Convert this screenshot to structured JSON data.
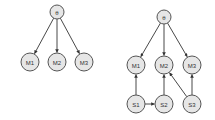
{
  "diagrams": [
    {
      "name": "left-graph",
      "nodes": [
        {
          "id": "root",
          "label": "θ",
          "x": 57,
          "y": 12,
          "r": 7
        },
        {
          "id": "M1",
          "label": "M1",
          "x": 30,
          "y": 62,
          "r": 9
        },
        {
          "id": "M2",
          "label": "M2",
          "x": 57,
          "y": 62,
          "r": 9
        },
        {
          "id": "M3",
          "label": "M3",
          "x": 84,
          "y": 62,
          "r": 9
        }
      ],
      "edges": [
        {
          "from": "root",
          "to": "M1"
        },
        {
          "from": "root",
          "to": "M2"
        },
        {
          "from": "root",
          "to": "M3"
        }
      ]
    },
    {
      "name": "right-graph",
      "nodes": [
        {
          "id": "root",
          "label": "θ",
          "x": 164,
          "y": 17,
          "r": 7
        },
        {
          "id": "M1",
          "label": "M1",
          "x": 136,
          "y": 65,
          "r": 9
        },
        {
          "id": "M2",
          "label": "M2",
          "x": 164,
          "y": 65,
          "r": 9
        },
        {
          "id": "M3",
          "label": "M3",
          "x": 192,
          "y": 65,
          "r": 9
        },
        {
          "id": "S1",
          "label": "S1",
          "x": 136,
          "y": 104,
          "r": 9
        },
        {
          "id": "S2",
          "label": "S2",
          "x": 164,
          "y": 104,
          "r": 9
        },
        {
          "id": "S3",
          "label": "S3",
          "x": 192,
          "y": 104,
          "r": 9
        }
      ],
      "edges": [
        {
          "from": "root",
          "to": "M1"
        },
        {
          "from": "root",
          "to": "M2"
        },
        {
          "from": "root",
          "to": "M3"
        },
        {
          "from": "S1",
          "to": "M1"
        },
        {
          "from": "S1",
          "to": "S2"
        },
        {
          "from": "S2",
          "to": "M2"
        },
        {
          "from": "S3",
          "to": "M2"
        },
        {
          "from": "S3",
          "to": "M3"
        }
      ]
    }
  ],
  "colors": {
    "node_fill": "#e6e6e6",
    "node_stroke": "#555555",
    "edge": "#333333",
    "text": "#333333"
  }
}
